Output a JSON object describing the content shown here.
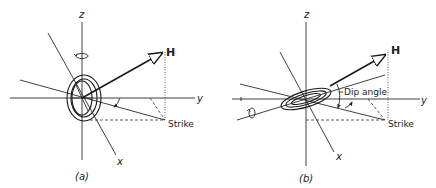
{
  "figure": {
    "panels": [
      {
        "id": "a",
        "caption": "(a)",
        "labels": {
          "z_axis": "z",
          "y_axis": "y",
          "x_axis": "x",
          "field_vector": "H",
          "strike": "Strike"
        },
        "coil_orientation": "vertical",
        "rotation_indicator": "about z-axis"
      },
      {
        "id": "b",
        "caption": "(b)",
        "labels": {
          "z_axis": "z",
          "y_axis": "y",
          "x_axis": "x",
          "field_vector": "H",
          "strike": "Strike",
          "dip_angle": "Dip angle"
        },
        "coil_orientation": "tilted",
        "rotation_indicator": "about strike axis"
      }
    ]
  }
}
